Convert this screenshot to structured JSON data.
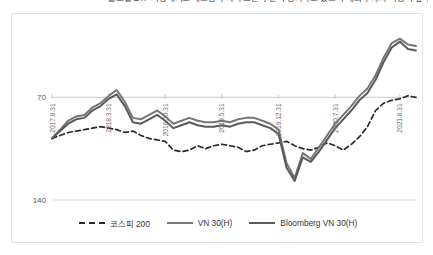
{
  "caption": {
    "text": "글로벌 ETF 시장에서도 베트남 투자 수요는 꾸준히 증가하고 있으며 해외 투자자 비중이 높다"
  },
  "legend": {
    "position": "bottom-center",
    "items": [
      {
        "label": "코스피 200",
        "style": "dashed",
        "color": "#2b2b2b",
        "key_name": "legend-key-kospi200"
      },
      {
        "label": "VN 30(H)",
        "style": "solid",
        "color": "#767676",
        "key_name": "legend-key-vn30h"
      },
      {
        "label": "Bloomberg VN 30(H)",
        "style": "solid",
        "color": "#5a5a5a",
        "key_name": "legend-key-bloomberg-vn30h"
      }
    ]
  },
  "axes": {
    "y_ticks": [
      "140",
      "70"
    ],
    "x_ticks": [
      "2017.8.31",
      "2018.3.31",
      "2018.10.31",
      "2019.5.31",
      "2019.12.31",
      "2020.7.31",
      "2021.8.31"
    ]
  },
  "chart_data": {
    "type": "line",
    "title": "",
    "subtitle": "",
    "xlabel": "",
    "ylabel": "",
    "ylim": [
      70,
      190
    ],
    "yticks": [
      70,
      140
    ],
    "grid": true,
    "legend_position": "bottom-center",
    "x_tick_labels": [
      "2017.8.31",
      "2018.3.31",
      "2018.10.31",
      "2019.5.31",
      "2019.12.31",
      "2020.7.31",
      "2021.8.31"
    ],
    "x_tick_positions": [
      0,
      7,
      14,
      21,
      28,
      35,
      43
    ],
    "x": [
      0,
      1,
      2,
      3,
      4,
      5,
      6,
      7,
      8,
      9,
      10,
      11,
      12,
      13,
      14,
      15,
      16,
      17,
      18,
      19,
      20,
      21,
      22,
      23,
      24,
      25,
      26,
      27,
      28,
      29,
      30,
      31,
      32,
      33,
      34,
      35,
      36,
      37,
      38,
      39,
      40,
      41,
      42,
      43,
      44,
      45
    ],
    "series": [
      {
        "name": "코스피 200",
        "style": "dashed",
        "color": "#2b2b2b",
        "values": [
          112,
          114,
          116,
          117,
          118,
          119,
          120,
          119,
          118,
          116,
          117,
          114,
          112,
          111,
          110,
          104,
          103,
          104,
          107,
          105,
          107,
          108,
          107,
          106,
          103,
          104,
          107,
          108,
          109,
          110,
          107,
          105,
          104,
          106,
          109,
          107,
          104,
          108,
          113,
          120,
          131,
          136,
          138,
          139,
          141,
          140
        ]
      },
      {
        "name": "VN 30(H)",
        "style": "solid",
        "color": "#767676",
        "values": [
          112,
          118,
          124,
          127,
          128,
          133,
          136,
          141,
          145,
          137,
          126,
          125,
          128,
          131,
          127,
          122,
          124,
          126,
          124,
          123,
          123,
          124,
          123,
          125,
          126,
          126,
          124,
          122,
          118,
          95,
          85,
          102,
          98,
          106,
          114,
          122,
          128,
          134,
          141,
          146,
          155,
          167,
          177,
          180,
          176,
          175
        ]
      },
      {
        "name": "Bloomberg VN 30(H)",
        "style": "solid",
        "color": "#5a5a5a",
        "values": [
          112,
          117,
          122,
          125,
          126,
          131,
          134,
          139,
          142,
          134,
          123,
          122,
          125,
          128,
          124,
          119,
          121,
          123,
          121,
          120,
          120,
          121,
          120,
          122,
          123,
          123,
          121,
          119,
          115,
          92,
          83,
          99,
          96,
          103,
          111,
          119,
          125,
          131,
          138,
          143,
          152,
          164,
          174,
          178,
          173,
          172
        ]
      }
    ]
  }
}
